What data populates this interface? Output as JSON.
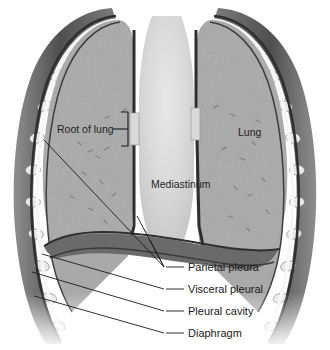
{
  "figure": {
    "background_color": "#ffffff",
    "ink_color": "#1b1b1b"
  },
  "palette": {
    "lung_tissue": "#a9a9a9",
    "lung_tissue_dark": "#9a9a9a",
    "mediastinum": "#d2d2d2",
    "mediastinum_light": "#e0e0e0",
    "pleura_line": "#3a3a3a",
    "pleural_cavity": "#f2f2f2",
    "chest_wall": "#6e6e6e",
    "chest_wall_dark": "#555555",
    "rib": "#e6e6e6",
    "diaphragm": "#666666",
    "leader_line": "#1b1b1b"
  },
  "labels": {
    "internal": [
      {
        "id": "root-of-lung",
        "text": "Root of lung",
        "x": 57,
        "y": 131,
        "anchor": "start"
      },
      {
        "id": "lung",
        "text": "Lung",
        "x": 238,
        "y": 133,
        "anchor": "start"
      },
      {
        "id": "mediastinum",
        "text": "Mediastinum",
        "x": 151,
        "y": 185,
        "anchor": "start"
      }
    ],
    "callouts": [
      {
        "id": "parietal-pleura",
        "text": "Parietal pleura",
        "x": 188,
        "y": 271,
        "dash_x1": 166,
        "dash_x2": 184,
        "dash_y": 267
      },
      {
        "id": "visceral-pleural",
        "text": "Visceral pleural",
        "x": 188,
        "y": 293,
        "dash_x1": 166,
        "dash_x2": 184,
        "dash_y": 289
      },
      {
        "id": "pleural-cavity",
        "text": "Pleural cavity",
        "x": 188,
        "y": 315,
        "dash_x1": 166,
        "dash_x2": 184,
        "dash_y": 311
      },
      {
        "id": "diaphragm",
        "text": "Diaphragm",
        "x": 188,
        "y": 337,
        "dash_x1": 166,
        "dash_x2": 184,
        "dash_y": 333
      }
    ]
  },
  "anatomy": {
    "parts": [
      "left-lung",
      "right-lung",
      "mediastinum",
      "chest-wall",
      "rib-cage",
      "diaphragm",
      "parietal-pleura",
      "visceral-pleura",
      "pleural-cavity",
      "root-of-lung-left",
      "root-of-lung-right"
    ],
    "rib_count_left": 9,
    "rib_count_right": 9
  }
}
